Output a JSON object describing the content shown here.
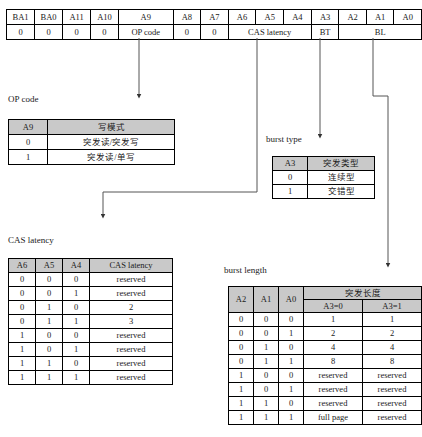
{
  "register": {
    "name": "mode-register-bit-map",
    "bit_labels": [
      "BA1",
      "BA0",
      "A11",
      "A10",
      "A9",
      "A8",
      "A7",
      "A6",
      "A5",
      "A4",
      "A3",
      "A2",
      "A1",
      "A0"
    ],
    "field_row": [
      {
        "text": "0",
        "span": 1
      },
      {
        "text": "0",
        "span": 1
      },
      {
        "text": "0",
        "span": 1
      },
      {
        "text": "0",
        "span": 1
      },
      {
        "text": "OP code",
        "span": 1
      },
      {
        "text": "0",
        "span": 1
      },
      {
        "text": "0",
        "span": 1
      },
      {
        "text": "CAS latency",
        "span": 3
      },
      {
        "text": "BT",
        "span": 1
      },
      {
        "text": "BL",
        "span": 3
      }
    ]
  },
  "op_code": {
    "caption": "OP code",
    "headers": [
      "A9",
      "写模式"
    ],
    "rows": [
      [
        "0",
        "突发读/突发写"
      ],
      [
        "1",
        "突发读/单写"
      ]
    ]
  },
  "burst_type": {
    "caption": "burst type",
    "headers": [
      "A3",
      "突发类型"
    ],
    "rows": [
      [
        "0",
        "连续型"
      ],
      [
        "1",
        "交错型"
      ]
    ]
  },
  "cas_latency": {
    "caption": "CAS latency",
    "headers": [
      "A6",
      "A5",
      "A4",
      "CAS latency"
    ],
    "rows": [
      [
        "0",
        "0",
        "0",
        "reserved"
      ],
      [
        "0",
        "0",
        "1",
        "reserved"
      ],
      [
        "0",
        "1",
        "0",
        "2"
      ],
      [
        "0",
        "1",
        "1",
        "3"
      ],
      [
        "1",
        "0",
        "0",
        "reserved"
      ],
      [
        "1",
        "0",
        "1",
        "reserved"
      ],
      [
        "1",
        "1",
        "0",
        "reserved"
      ],
      [
        "1",
        "1",
        "1",
        "reserved"
      ]
    ]
  },
  "burst_length": {
    "caption": "burst length",
    "headers": [
      "A2",
      "A1",
      "A0"
    ],
    "group_header": "突发长度",
    "sub_headers": [
      "A3=0",
      "A3=1"
    ],
    "rows": [
      [
        "0",
        "0",
        "0",
        "1",
        "1"
      ],
      [
        "0",
        "0",
        "1",
        "2",
        "2"
      ],
      [
        "0",
        "1",
        "0",
        "4",
        "4"
      ],
      [
        "0",
        "1",
        "1",
        "8",
        "8"
      ],
      [
        "1",
        "0",
        "0",
        "reserved",
        "reserved"
      ],
      [
        "1",
        "0",
        "1",
        "reserved",
        "reserved"
      ],
      [
        "1",
        "1",
        "0",
        "reserved",
        "reserved"
      ],
      [
        "1",
        "1",
        "1",
        "full page",
        "reserved"
      ]
    ]
  },
  "connectors": [
    {
      "name": "a9-to-op-code",
      "from_bit": "A9",
      "to_table": "op-code-table"
    },
    {
      "name": "a6a4-to-cas-latency",
      "from_bit": "CAS latency",
      "to_table": "cas-latency-table"
    },
    {
      "name": "a3-to-burst-type",
      "from_bit": "A3",
      "to_table": "burst-type-table"
    },
    {
      "name": "a1-to-burst-length",
      "from_bit": "BL",
      "to_table": "burst-length-table"
    }
  ]
}
